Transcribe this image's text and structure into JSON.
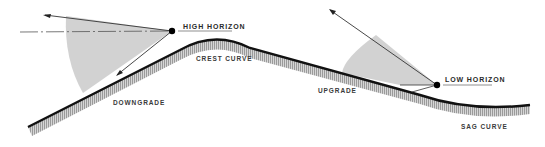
{
  "diagram": {
    "labels": {
      "high_horizon": "HIGH HORIZON",
      "low_horizon": "LOW HORIZON",
      "crest_curve": "CREST CURVE",
      "downgrade": "DOWNGRADE",
      "upgrade": "UPGRADE",
      "sag_curve": "SAG CURVE"
    },
    "colors": {
      "road": "#111111",
      "hatch": "#9a9a9a",
      "wedge": "#cfcfcf",
      "line": "#333333"
    }
  }
}
